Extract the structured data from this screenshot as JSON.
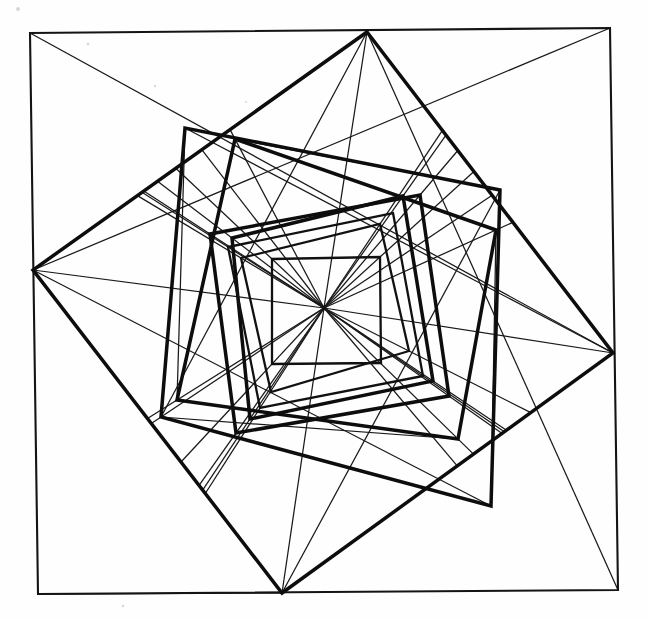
{
  "figure": {
    "background_color": "#fefefe",
    "ink_color": "#111111",
    "canvas": {
      "width": 649,
      "height": 620
    }
  },
  "chart_data": {
    "type": "line",
    "xlabel": "",
    "ylabel": "",
    "xlim": [
      0,
      649
    ],
    "ylim": [
      0,
      620
    ],
    "grid": false,
    "legend": "none",
    "center": {
      "x": 324,
      "y": 308
    },
    "ray_count": 24,
    "ray_stroke_width": 1.25,
    "square_count": 9,
    "series": [
      {
        "name": "square-1-outer",
        "stroke_width": 2.1,
        "weight": "thin",
        "closed": true,
        "points": [
          [
            30,
            33
          ],
          [
            610,
            28
          ],
          [
            618,
            590
          ],
          [
            38,
            594
          ]
        ]
      },
      {
        "name": "square-2",
        "stroke_width": 3.5,
        "weight": "thick",
        "closed": true,
        "points": [
          [
            367,
            32
          ],
          [
            613,
            353
          ],
          [
            282,
            593
          ],
          [
            33,
            270
          ]
        ]
      },
      {
        "name": "square-3",
        "stroke_width": 3.5,
        "weight": "thick",
        "closed": true,
        "points": [
          [
            500,
            190
          ],
          [
            491,
            506
          ],
          [
            161,
            417
          ],
          [
            185,
            128
          ]
        ]
      },
      {
        "name": "square-4",
        "stroke_width": 3.5,
        "weight": "thick",
        "closed": true,
        "points": [
          [
            458,
            439
          ],
          [
            177,
            400
          ],
          [
            235,
            139
          ],
          [
            496,
            230
          ]
        ]
      },
      {
        "name": "square-5",
        "stroke_width": 3.0,
        "weight": "thick",
        "closed": true,
        "points": [
          [
            236,
            433
          ],
          [
            210,
            234
          ],
          [
            420,
            195
          ],
          [
            449,
            396
          ]
        ]
      },
      {
        "name": "square-6",
        "stroke_width": 2.8,
        "weight": "thick",
        "closed": true,
        "points": [
          [
            232,
            238
          ],
          [
            403,
            196
          ],
          [
            433,
            381
          ],
          [
            250,
            419
          ]
        ]
      },
      {
        "name": "square-7",
        "stroke_width": 2.5,
        "weight": "thin",
        "closed": true,
        "points": [
          [
            393,
            213
          ],
          [
            423,
            376
          ],
          [
            260,
            408
          ],
          [
            228,
            247
          ]
        ]
      },
      {
        "name": "square-8",
        "stroke_width": 2.4,
        "weight": "thin",
        "closed": true,
        "points": [
          [
            409,
            351
          ],
          [
            271,
            392
          ],
          [
            241,
            258
          ],
          [
            380,
            224
          ]
        ]
      },
      {
        "name": "square-9-inner",
        "stroke_width": 2.3,
        "weight": "thin",
        "closed": true,
        "points": [
          [
            272,
            259
          ],
          [
            380,
            257
          ],
          [
            381,
            363
          ],
          [
            272,
            364
          ]
        ]
      }
    ]
  },
  "paper": {
    "specks": [
      {
        "x": 18,
        "y": 9,
        "r": 2.0
      },
      {
        "x": 88,
        "y": 44,
        "r": 1.4
      },
      {
        "x": 155,
        "y": 86,
        "r": 1.2
      },
      {
        "x": 246,
        "y": 102,
        "r": 1.0
      },
      {
        "x": 123,
        "y": 606,
        "r": 1.3
      }
    ]
  }
}
